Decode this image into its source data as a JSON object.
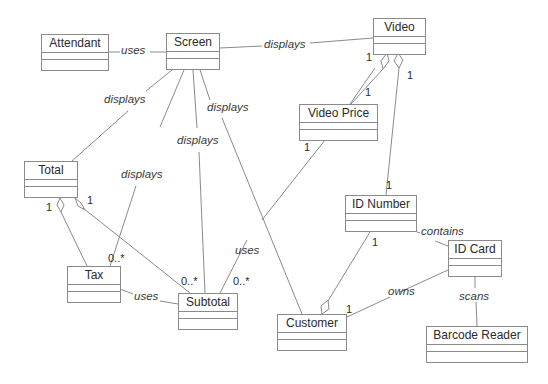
{
  "diagram": {
    "type": "uml-class-diagram",
    "classes": [
      {
        "id": "attendant",
        "name": "Attendant",
        "x": 41,
        "y": 34,
        "w": 68
      },
      {
        "id": "screen",
        "name": "Screen",
        "x": 166,
        "y": 33,
        "w": 54
      },
      {
        "id": "video",
        "name": "Video",
        "x": 373,
        "y": 18,
        "w": 53
      },
      {
        "id": "video_price",
        "name": "Video Price",
        "x": 299,
        "y": 104,
        "w": 79
      },
      {
        "id": "total",
        "name": "Total",
        "x": 24,
        "y": 161,
        "w": 54
      },
      {
        "id": "tax",
        "name": "Tax",
        "x": 67,
        "y": 266,
        "w": 54
      },
      {
        "id": "subtotal",
        "name": "Subtotal",
        "x": 178,
        "y": 293,
        "w": 60
      },
      {
        "id": "id_number",
        "name": "ID Number",
        "x": 345,
        "y": 195,
        "w": 72
      },
      {
        "id": "id_card",
        "name": "ID Card",
        "x": 448,
        "y": 240,
        "w": 54
      },
      {
        "id": "customer",
        "name": "Customer",
        "x": 277,
        "y": 314,
        "w": 70
      },
      {
        "id": "barcode_reader",
        "name": "Barcode Reader",
        "x": 426,
        "y": 326,
        "w": 102
      }
    ],
    "associations": [
      {
        "from": "Attendant",
        "to": "Screen",
        "label": "uses"
      },
      {
        "from": "Screen",
        "to": "Video",
        "label": "displays"
      },
      {
        "from": "Screen",
        "to": "Total",
        "label": "displays"
      },
      {
        "from": "Screen",
        "to": "Tax",
        "label": "displays",
        "to_mult": "0..*"
      },
      {
        "from": "Screen",
        "to": "Subtotal",
        "label": "displays"
      },
      {
        "from": "Screen",
        "to": "Customer",
        "label": ""
      },
      {
        "from": "Video",
        "to": "Video Price",
        "kind": "aggregation",
        "from_mult": "1",
        "to_mult": "1"
      },
      {
        "from": "Video",
        "to": "ID Number",
        "kind": "aggregation",
        "from_mult": "1",
        "to_mult": "1"
      },
      {
        "from": "Video Price",
        "to": "Subtotal",
        "label": "uses",
        "from_mult": "1",
        "to_mult": "0..*"
      },
      {
        "from": "Total",
        "to": "Tax",
        "kind": "aggregation",
        "from_mult": "1"
      },
      {
        "from": "Total",
        "to": "Subtotal",
        "kind": "aggregation",
        "from_mult": "1",
        "to_mult": "0..*"
      },
      {
        "from": "Tax",
        "to": "Subtotal",
        "label": "uses"
      },
      {
        "from": "ID Number",
        "to": "ID Card",
        "label": "contains"
      },
      {
        "from": "Customer",
        "to": "ID Number",
        "kind": "aggregation",
        "to_mult": "1"
      },
      {
        "from": "ID Card",
        "to": "Customer",
        "label": "owns",
        "to_mult": "1"
      },
      {
        "from": "ID Card",
        "to": "Barcode Reader",
        "label": "scans"
      }
    ],
    "labels": {
      "uses_attendant": "uses",
      "displays_video": "displays",
      "displays_total": "displays",
      "displays_subtotal": "displays",
      "displays_tax": "displays",
      "uses_videoprice": "uses",
      "uses_tax": "uses",
      "contains": "contains",
      "owns": "owns",
      "scans": "scans"
    },
    "multiplicities": {
      "video_vp": "1",
      "vp_top": "1",
      "video_idn": "1",
      "idn_top": "1",
      "vp_bottom": "1",
      "total_tax": "1",
      "total_sub": "1",
      "tax_screen": "0..*",
      "sub_total": "0..*",
      "sub_vp": "0..*",
      "idn_cust": "1",
      "cust_card": "1"
    },
    "colors": {
      "line": "#8a8a8a",
      "text": "#2a2a2a",
      "background": "#ffffff"
    }
  }
}
